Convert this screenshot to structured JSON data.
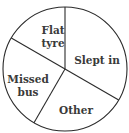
{
  "chart_data": {
    "type": "pie",
    "title": "",
    "start_angle_deg_clockwise_from_top": 0,
    "direction": "clockwise",
    "categories": [
      "Slept in",
      "Other",
      "Missed bus",
      "Flat tyre"
    ],
    "values": [
      120,
      90,
      90,
      60
    ],
    "value_unit": "degrees (estimated from slice boundaries; no values shown)",
    "fractions": [
      0.3333,
      0.25,
      0.25,
      0.1667
    ],
    "labels_inside": true,
    "legend": "none",
    "colors": {
      "fill": "#ffffff",
      "stroke": "#2b2b2b",
      "label": "#3a3a3a"
    }
  },
  "labels": {
    "slept_in": [
      "Slept in"
    ],
    "other": [
      "Other"
    ],
    "missed_bus": [
      "Missed",
      "bus"
    ],
    "flat_tyre": [
      "Flat",
      "tyre"
    ]
  }
}
